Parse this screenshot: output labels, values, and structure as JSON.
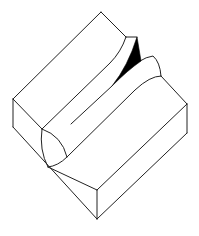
{
  "figure": {
    "type": "isometric weld bead diagram",
    "colors": {
      "stroke": "#222222",
      "fill": "#000000",
      "background": "#ffffff"
    },
    "labels": []
  }
}
